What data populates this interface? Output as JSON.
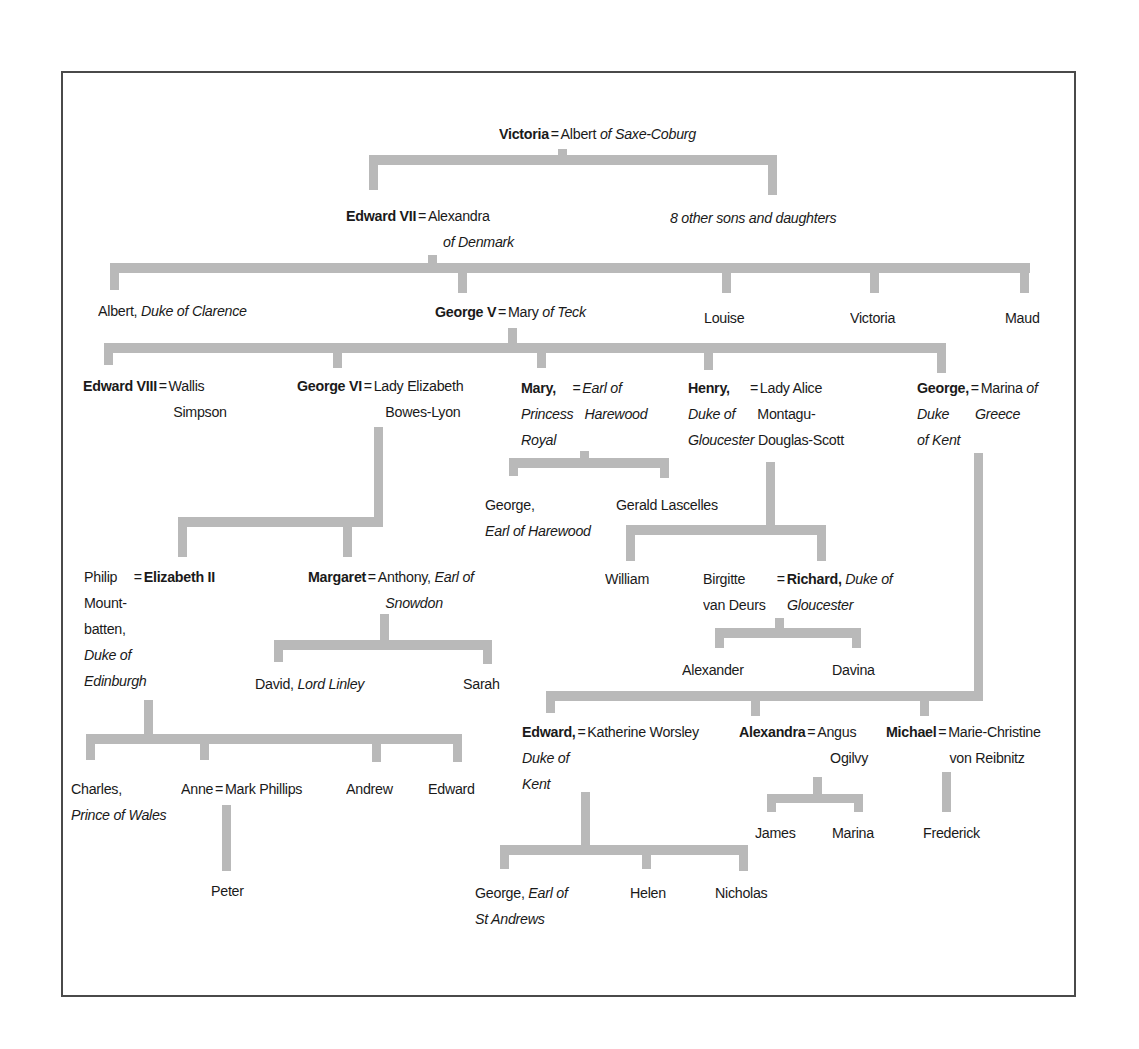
{
  "diagram": {
    "type": "family-tree",
    "line_color": "#b9b9b9",
    "frame_color": "#4a4a4a"
  },
  "nodes": {
    "victoria": {
      "name": "Victoria",
      "eq": "=",
      "spouse": "Albert",
      "spouse_title": "of Saxe-Coburg"
    },
    "edward7": {
      "name": "Edward VII",
      "eq": "=",
      "spouse": "Alexandra",
      "spouse_title": "of Denmark"
    },
    "others8": {
      "text": "8 other sons and daughters"
    },
    "albert_clarence": {
      "name": "Albert,",
      "title": "Duke of Clarence"
    },
    "george5": {
      "name": "George V",
      "eq": "=",
      "spouse": "Mary",
      "spouse_title": "of Teck"
    },
    "louise": {
      "name": "Louise"
    },
    "victoria2": {
      "name": "Victoria"
    },
    "maud": {
      "name": "Maud"
    },
    "edward8": {
      "name": "Edward VIII",
      "eq": "=",
      "spouse_l1": "Wallis",
      "spouse_l2": "Simpson"
    },
    "george6": {
      "name": "George VI",
      "eq": "=",
      "spouse_l1": "Lady Elizabeth",
      "spouse_l2": "Bowes-Lyon"
    },
    "mary": {
      "name": "Mary,",
      "title_l1": "Princess",
      "title_l2": "Royal",
      "eq": "=",
      "spouse_l1": "Earl of",
      "spouse_l2": "Harewood"
    },
    "henry": {
      "name": "Henry,",
      "title_l1": "Duke of",
      "title_l2": "Gloucester",
      "eq": "=",
      "spouse_l1": "Lady Alice",
      "spouse_l2": "Montagu-",
      "spouse_l3": "Douglas-Scott"
    },
    "george_kent": {
      "name": "George,",
      "title_l1": "Duke",
      "title_l2": "of Kent",
      "eq": "=",
      "spouse_l1": "Marina",
      "spouse_l1b": "of",
      "spouse_l2": "Greece"
    },
    "george_harewood": {
      "name": "George,",
      "title": "Earl of Harewood"
    },
    "gerald": {
      "name": "Gerald Lascelles"
    },
    "william": {
      "name": "William"
    },
    "birgitte": {
      "l1": "Birgitte",
      "l2": "van Deurs"
    },
    "richard": {
      "eq": "=",
      "name": "Richard,",
      "title_l1": "Duke of",
      "title_l2": "Gloucester"
    },
    "alexander": {
      "name": "Alexander"
    },
    "davina": {
      "name": "Davina"
    },
    "philip": {
      "l1": "Philip",
      "l2": "Mount-",
      "l3": "batten,",
      "l4": "Duke of",
      "l5": "Edinburgh"
    },
    "elizabeth2": {
      "eq": "=",
      "name": "Elizabeth II"
    },
    "margaret": {
      "name": "Margaret",
      "eq": "=",
      "spouse": "Anthony,",
      "spouse_title_l1": "Earl of",
      "spouse_title_l2": "Snowdon"
    },
    "david": {
      "name": "David,",
      "title": "Lord Linley"
    },
    "sarah": {
      "name": "Sarah"
    },
    "charles": {
      "name": "Charles,",
      "title": "Prince of Wales"
    },
    "anne": {
      "name": "Anne",
      "eq": "=",
      "spouse": "Mark Phillips"
    },
    "andrew": {
      "name": "Andrew"
    },
    "edward": {
      "name": "Edward"
    },
    "peter": {
      "name": "Peter"
    },
    "edward_kent": {
      "name": "Edward,",
      "title_l1": "Duke of",
      "title_l2": "Kent",
      "eq": "=",
      "spouse": "Katherine Worsley"
    },
    "alexandra": {
      "name": "Alexandra",
      "eq": "=",
      "spouse_l1": "Angus",
      "spouse_l2": "Ogilvy"
    },
    "michael": {
      "name": "Michael",
      "eq": "=",
      "spouse_l1": "Marie-Christine",
      "spouse_l2": "von Reibnitz"
    },
    "james": {
      "name": "James"
    },
    "marina": {
      "name": "Marina"
    },
    "frederick": {
      "name": "Frederick"
    },
    "george_standrews": {
      "name": "George,",
      "title_l1": "Earl of",
      "title_l2": "St Andrews"
    },
    "helen": {
      "name": "Helen"
    },
    "nicholas": {
      "name": "Nicholas"
    }
  }
}
